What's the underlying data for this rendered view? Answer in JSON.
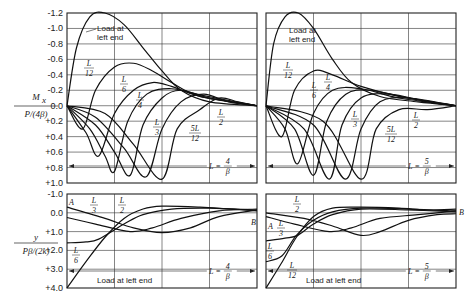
{
  "chart_data": [
    {
      "type": "line",
      "panel": "top-left",
      "ylabel_num": "M",
      "ylabel_sub": "x",
      "ylabel_den": "P/(4β)",
      "yticks": [
        "-1.2",
        "-1.0",
        "-0.8",
        "-0.6",
        "-0.4",
        "-0.2",
        "0.0",
        "+0.2",
        "+0.4",
        "+0.6",
        "+0.8",
        "+1.0"
      ],
      "ylim": [
        -1.2,
        1.0
      ],
      "x_range_label": {
        "L": "L =",
        "num": "4",
        "den": "β"
      },
      "series": [
        {
          "name": "Load at left end",
          "points": [
            [
              0,
              0
            ],
            [
              0.05,
              -0.75
            ],
            [
              0.12,
              -1.15
            ],
            [
              0.2,
              -1.2
            ],
            [
              0.3,
              -1.05
            ],
            [
              0.4,
              -0.75
            ],
            [
              0.5,
              -0.45
            ],
            [
              0.6,
              -0.2
            ],
            [
              0.75,
              -0.05
            ],
            [
              1,
              0
            ]
          ]
        },
        {
          "name": "L/12",
          "points": [
            [
              0,
              0
            ],
            [
              0.083,
              0.3
            ],
            [
              0.15,
              -0.2
            ],
            [
              0.25,
              -0.5
            ],
            [
              0.35,
              -0.55
            ],
            [
              0.45,
              -0.45
            ],
            [
              0.55,
              -0.3
            ],
            [
              0.7,
              -0.12
            ],
            [
              1,
              0
            ]
          ]
        },
        {
          "name": "L/6",
          "points": [
            [
              0,
              0
            ],
            [
              0.1,
              0.35
            ],
            [
              0.167,
              0.65
            ],
            [
              0.25,
              0.1
            ],
            [
              0.35,
              -0.2
            ],
            [
              0.45,
              -0.3
            ],
            [
              0.55,
              -0.25
            ],
            [
              0.7,
              -0.12
            ],
            [
              1,
              0
            ]
          ]
        },
        {
          "name": "L/4",
          "points": [
            [
              0,
              0
            ],
            [
              0.12,
              0.3
            ],
            [
              0.2,
              0.65
            ],
            [
              0.25,
              0.85
            ],
            [
              0.32,
              0.2
            ],
            [
              0.42,
              -0.15
            ],
            [
              0.55,
              -0.22
            ],
            [
              0.7,
              -0.14
            ],
            [
              1,
              0
            ]
          ]
        },
        {
          "name": "L/3",
          "points": [
            [
              0,
              0
            ],
            [
              0.15,
              0.25
            ],
            [
              0.25,
              0.6
            ],
            [
              0.333,
              0.9
            ],
            [
              0.4,
              0.25
            ],
            [
              0.5,
              -0.1
            ],
            [
              0.6,
              -0.2
            ],
            [
              0.75,
              -0.1
            ],
            [
              1,
              0
            ]
          ]
        },
        {
          "name": "5L/12",
          "points": [
            [
              0,
              0
            ],
            [
              0.15,
              0.15
            ],
            [
              0.3,
              0.55
            ],
            [
              0.417,
              0.92
            ],
            [
              0.5,
              0.3
            ],
            [
              0.6,
              -0.05
            ],
            [
              0.72,
              -0.15
            ],
            [
              0.85,
              -0.05
            ],
            [
              1,
              0
            ]
          ]
        },
        {
          "name": "L/2",
          "points": [
            [
              0,
              0
            ],
            [
              0.2,
              0.1
            ],
            [
              0.35,
              0.5
            ],
            [
              0.5,
              0.95
            ],
            [
              0.58,
              0.3
            ],
            [
              0.7,
              0.05
            ],
            [
              0.8,
              -0.1
            ],
            [
              0.9,
              -0.05
            ],
            [
              1,
              0
            ]
          ]
        }
      ]
    },
    {
      "type": "line",
      "panel": "top-right",
      "ylim": [
        -1.2,
        1.0
      ],
      "x_range_label": {
        "L": "L =",
        "num": "5",
        "den": "β"
      },
      "series": [
        {
          "name": "Load at left end",
          "points": [
            [
              0,
              0
            ],
            [
              0.04,
              -0.8
            ],
            [
              0.1,
              -1.15
            ],
            [
              0.17,
              -1.2
            ],
            [
              0.25,
              -1.0
            ],
            [
              0.35,
              -0.6
            ],
            [
              0.45,
              -0.3
            ],
            [
              0.6,
              -0.12
            ],
            [
              0.8,
              -0.05
            ],
            [
              1,
              0
            ]
          ]
        },
        {
          "name": "L/12",
          "points": [
            [
              0,
              0
            ],
            [
              0.083,
              0.4
            ],
            [
              0.15,
              -0.2
            ],
            [
              0.25,
              -0.45
            ],
            [
              0.35,
              -0.4
            ],
            [
              0.5,
              -0.25
            ],
            [
              0.7,
              -0.12
            ],
            [
              1,
              0
            ]
          ]
        },
        {
          "name": "L/6",
          "points": [
            [
              0,
              0
            ],
            [
              0.1,
              0.3
            ],
            [
              0.167,
              0.75
            ],
            [
              0.25,
              0.1
            ],
            [
              0.35,
              -0.2
            ],
            [
              0.5,
              -0.22
            ],
            [
              0.7,
              -0.1
            ],
            [
              1,
              0
            ]
          ]
        },
        {
          "name": "L/4",
          "points": [
            [
              0,
              0
            ],
            [
              0.15,
              0.3
            ],
            [
              0.25,
              0.9
            ],
            [
              0.32,
              0.2
            ],
            [
              0.42,
              -0.15
            ],
            [
              0.55,
              -0.2
            ],
            [
              0.75,
              -0.1
            ],
            [
              1,
              0
            ]
          ]
        },
        {
          "name": "L/3",
          "points": [
            [
              0,
              0
            ],
            [
              0.2,
              0.3
            ],
            [
              0.333,
              0.95
            ],
            [
              0.4,
              0.25
            ],
            [
              0.5,
              -0.1
            ],
            [
              0.65,
              -0.15
            ],
            [
              0.85,
              -0.05
            ],
            [
              1,
              0
            ]
          ]
        },
        {
          "name": "5L/12",
          "points": [
            [
              0,
              0
            ],
            [
              0.25,
              0.25
            ],
            [
              0.417,
              0.95
            ],
            [
              0.5,
              0.3
            ],
            [
              0.6,
              -0.05
            ],
            [
              0.75,
              -0.1
            ],
            [
              1,
              0
            ]
          ]
        },
        {
          "name": "L/2",
          "points": [
            [
              0,
              0
            ],
            [
              0.3,
              0.2
            ],
            [
              0.5,
              0.95
            ],
            [
              0.58,
              0.3
            ],
            [
              0.7,
              0.05
            ],
            [
              0.85,
              0.05
            ],
            [
              1,
              0
            ]
          ]
        }
      ]
    },
    {
      "type": "line",
      "panel": "bottom-left",
      "ylabel_num": "y",
      "ylabel_den": "Pβ/(2k)",
      "yticks": [
        "-1.0",
        "0.0",
        "+1.0",
        "+2.0",
        "+3.0",
        "+4.0"
      ],
      "ylim": [
        -1.0,
        4.0
      ],
      "x_range_label": {
        "L": "L =",
        "num": "4",
        "den": "β"
      },
      "end_labels": {
        "left": "A",
        "right": "B"
      },
      "series": [
        {
          "name": "Load at left end",
          "points": [
            [
              0,
              4.0
            ],
            [
              0.1,
              2.6
            ],
            [
              0.2,
              1.3
            ],
            [
              0.3,
              0.3
            ],
            [
              0.4,
              -0.2
            ],
            [
              0.5,
              -0.35
            ],
            [
              0.7,
              -0.3
            ],
            [
              0.85,
              -0.2
            ],
            [
              1,
              -0.1
            ]
          ]
        },
        {
          "name": "L/6",
          "points": [
            [
              0,
              1.6
            ],
            [
              0.1,
              1.55
            ],
            [
              0.167,
              1.4
            ],
            [
              0.3,
              0.6
            ],
            [
              0.4,
              0.1
            ],
            [
              0.55,
              -0.2
            ],
            [
              0.75,
              -0.25
            ],
            [
              1,
              -0.15
            ]
          ]
        },
        {
          "name": "L/3",
          "points": [
            [
              0,
              0.25
            ],
            [
              0.15,
              0.6
            ],
            [
              0.333,
              1.0
            ],
            [
              0.45,
              0.8
            ],
            [
              0.6,
              0.3
            ],
            [
              0.8,
              -0.1
            ],
            [
              1,
              -0.2
            ]
          ]
        },
        {
          "name": "L/2",
          "points": [
            [
              0,
              -0.3
            ],
            [
              0.2,
              0.3
            ],
            [
              0.35,
              0.8
            ],
            [
              0.5,
              1.05
            ],
            [
              0.65,
              0.8
            ],
            [
              0.8,
              0.2
            ],
            [
              1,
              -0.15
            ]
          ]
        }
      ]
    },
    {
      "type": "line",
      "panel": "bottom-right",
      "ylim": [
        -1.0,
        4.0
      ],
      "x_range_label": {
        "L": "L =",
        "num": "5",
        "den": "β"
      },
      "end_labels": {
        "left": "A",
        "right": "B"
      },
      "series": [
        {
          "name": "Load at left end",
          "points": [
            [
              0,
              4.0
            ],
            [
              0.08,
              2.7
            ],
            [
              0.16,
              1.3
            ],
            [
              0.25,
              0.2
            ],
            [
              0.35,
              -0.25
            ],
            [
              0.5,
              -0.3
            ],
            [
              0.7,
              -0.25
            ],
            [
              0.85,
              -0.15
            ],
            [
              1,
              -0.2
            ]
          ]
        },
        {
          "name": "L/12",
          "points": [
            [
              0,
              2.6
            ],
            [
              0.083,
              2.3
            ],
            [
              0.16,
              1.2
            ],
            [
              0.25,
              0.4
            ],
            [
              0.35,
              -0.05
            ],
            [
              0.5,
              -0.25
            ],
            [
              0.75,
              -0.2
            ],
            [
              1,
              -0.1
            ]
          ]
        },
        {
          "name": "L/6",
          "points": [
            [
              0,
              1.5
            ],
            [
              0.1,
              1.35
            ],
            [
              0.167,
              1.2
            ],
            [
              0.25,
              0.6
            ],
            [
              0.35,
              0.1
            ],
            [
              0.5,
              -0.2
            ],
            [
              0.75,
              -0.15
            ],
            [
              1,
              -0.05
            ]
          ]
        },
        {
          "name": "L/3",
          "points": [
            [
              0,
              0.2
            ],
            [
              0.15,
              0.6
            ],
            [
              0.333,
              1.0
            ],
            [
              0.45,
              0.8
            ],
            [
              0.6,
              0.3
            ],
            [
              0.8,
              0.1
            ],
            [
              1,
              -0.1
            ]
          ]
        },
        {
          "name": "L/2",
          "points": [
            [
              0,
              0.0
            ],
            [
              0.2,
              0.3
            ],
            [
              0.35,
              0.7
            ],
            [
              0.5,
              1.2
            ],
            [
              0.6,
              1.0
            ],
            [
              0.75,
              0.4
            ],
            [
              0.9,
              0.1
            ],
            [
              1,
              0.05
            ]
          ]
        }
      ]
    }
  ],
  "labels": {
    "load_at": "Load at",
    "left_end": "left end",
    "load_at_left_end": "Load at left end",
    "L": "L",
    "n12": "12",
    "n6": "6",
    "n4": "4",
    "n3": "3",
    "n2": "2",
    "fiveL": "5L",
    "A": "A",
    "B": "B"
  }
}
